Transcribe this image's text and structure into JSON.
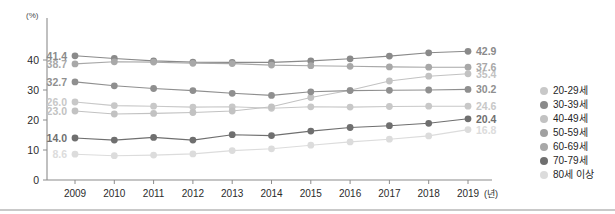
{
  "chart_data": {
    "type": "line",
    "title": "",
    "xlabel": "(년)",
    "ylabel": "(%)",
    "x": [
      "2009",
      "2010",
      "2011",
      "2012",
      "2013",
      "2014",
      "2015",
      "2016",
      "2017",
      "2018",
      "2019"
    ],
    "ylim": [
      0,
      44
    ],
    "yticks": [
      0,
      10,
      20,
      30,
      40
    ],
    "ytick_labels": [
      "0",
      "10",
      "20",
      "30",
      "40"
    ],
    "grid": false,
    "legend_position": "right",
    "series": [
      {
        "name": "20-29세",
        "color": "#c8c8c8",
        "start_label": "26.0",
        "end_label": "24.6",
        "values": [
          26.0,
          24.8,
          24.6,
          24.3,
          24.4,
          23.9,
          24.4,
          24.3,
          24.5,
          24.6,
          24.6
        ]
      },
      {
        "name": "30-39세",
        "color": "#8a8a8a",
        "start_label": "41.4",
        "end_label": "42.9",
        "values": [
          41.4,
          40.5,
          39.7,
          39.3,
          39.2,
          39.2,
          39.7,
          40.4,
          41.3,
          42.4,
          42.9
        ]
      },
      {
        "name": "40-49세",
        "color": "#c2c2c2",
        "start_label": "23.0",
        "end_label": "35.4",
        "values": [
          23.0,
          22.0,
          22.2,
          22.5,
          23.0,
          24.4,
          27.5,
          29.9,
          33.0,
          34.6,
          35.4
        ]
      },
      {
        "name": "50-59세",
        "color": "#8f8f8f",
        "start_label": "32.7",
        "end_label": "30.2",
        "values": [
          32.7,
          31.4,
          30.5,
          29.8,
          28.9,
          28.2,
          29.4,
          29.8,
          29.9,
          30.0,
          30.2
        ]
      },
      {
        "name": "60-69세",
        "color": "#a8a8a8",
        "start_label": "38.7",
        "end_label": "37.6",
        "values": [
          38.7,
          39.4,
          39.3,
          38.9,
          38.8,
          38.3,
          38.1,
          37.9,
          37.7,
          37.6,
          37.6
        ]
      },
      {
        "name": "70-79세",
        "color": "#6f6f6f",
        "start_label": "14.0",
        "end_label": "20.4",
        "values": [
          14.0,
          13.3,
          14.2,
          13.3,
          15.1,
          14.8,
          16.3,
          17.5,
          18.1,
          18.9,
          20.4
        ]
      },
      {
        "name": "80세 이상",
        "color": "#dcdcdc",
        "start_label": "8.6",
        "end_label": "16.8",
        "values": [
          8.6,
          8.1,
          8.3,
          8.7,
          9.8,
          10.4,
          11.6,
          12.7,
          13.6,
          14.7,
          16.8
        ]
      }
    ]
  },
  "axis": {
    "y_unit": "(%)",
    "x_unit": "(년)"
  },
  "legend": {
    "items": [
      {
        "label": "20-29세",
        "color": "#c8c8c8"
      },
      {
        "label": "30-39세",
        "color": "#8a8a8a"
      },
      {
        "label": "40-49세",
        "color": "#c2c2c2"
      },
      {
        "label": "50-59세",
        "color": "#a0a0a0"
      },
      {
        "label": "60-69세",
        "color": "#a8a8a8"
      },
      {
        "label": "70-79세",
        "color": "#6f6f6f"
      },
      {
        "label": "80세 이상",
        "color": "#dcdcdc"
      }
    ]
  }
}
